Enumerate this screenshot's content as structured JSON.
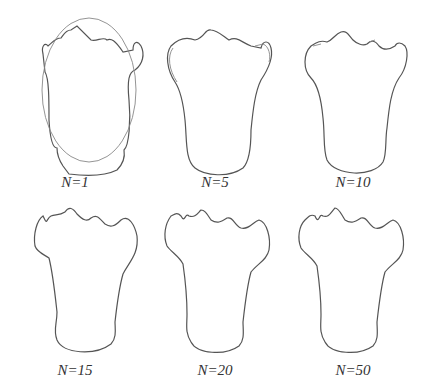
{
  "figure": {
    "panels": [
      {
        "label": "N=1",
        "has_ellipse": true
      },
      {
        "label": "N=5"
      },
      {
        "label": "N=10"
      },
      {
        "label": "N=15"
      },
      {
        "label": "N=20"
      },
      {
        "label": "N=50"
      }
    ],
    "colors": {
      "stroke": "#555555",
      "approx_stroke": "#888888",
      "background": "#ffffff"
    }
  }
}
